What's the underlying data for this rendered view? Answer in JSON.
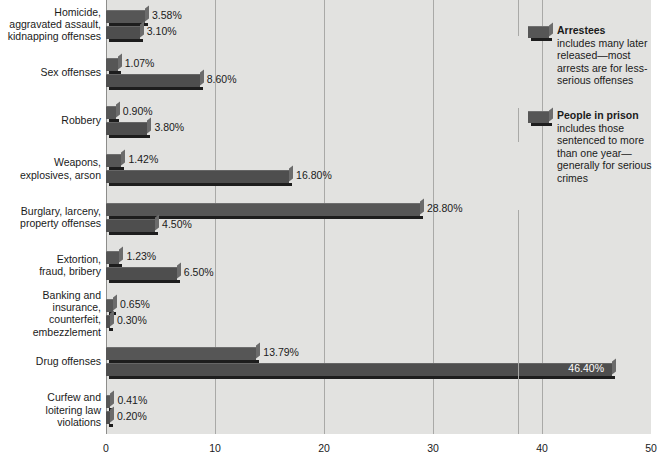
{
  "chart_data": {
    "type": "bar",
    "orientation": "horizontal",
    "title": "",
    "subtitle": "",
    "xlabel": "",
    "ylabel": "",
    "xlim": [
      0,
      50
    ],
    "xticks": [
      "0",
      "10",
      "20",
      "30",
      "40",
      "50"
    ],
    "grid": true,
    "legend_position": "right",
    "categories": [
      "Homicide,\naggravated assault,\nkidnapping offenses",
      "Sex offenses",
      "Robbery",
      "Weapons,\nexplosives, arson",
      "Burglary, larceny,\nproperty offenses",
      "Extortion,\nfraud, bribery",
      "Banking and\ninsurance,\ncounterfeit,\nembezzlement",
      "Drug offenses",
      "Curfew and\nloitering law\nviolations"
    ],
    "series": [
      {
        "name": "Arrestees",
        "values": [
          3.58,
          1.07,
          0.9,
          1.42,
          28.8,
          1.23,
          0.65,
          13.79,
          0.41
        ],
        "labels": [
          "3.58%",
          "1.07%",
          "0.90%",
          "1.42%",
          "28.80%",
          "1.23%",
          "0.65%",
          "13.79%",
          "0.41%"
        ],
        "color": "#565656"
      },
      {
        "name": "People in prison",
        "values": [
          3.1,
          8.6,
          3.8,
          16.8,
          4.5,
          6.5,
          0.3,
          46.4,
          0.2
        ],
        "labels": [
          "3.10%",
          "8.60%",
          "3.80%",
          "16.80%",
          "4.50%",
          "6.50%",
          "0.30%",
          "46.40%",
          "0.20%"
        ],
        "color": "#4e4e4e"
      }
    ]
  },
  "legend": {
    "entries": [
      {
        "title": "Arrestees",
        "description": "includes many later released—most arrests are for less-serious offenses"
      },
      {
        "title": "People in prison",
        "description": "includes those sentenced to more than one year—generally for serious crimes"
      }
    ]
  },
  "colors": {
    "plot_background": "#e2e2e0",
    "gridline": "#a9a9a7",
    "arrestees_bar": "#565656",
    "prison_bar": "#4e4e4e",
    "text": "#1a1a1a"
  }
}
